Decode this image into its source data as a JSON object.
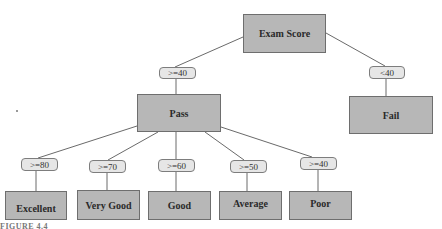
{
  "diagram": {
    "type": "decision-tree",
    "root": {
      "id": "exam",
      "label": "Exam Score"
    },
    "nodes": [
      {
        "id": "exam",
        "label": "Exam Score",
        "x": 243,
        "y": 14,
        "w": 83,
        "h": 39
      },
      {
        "id": "pass",
        "label": "Pass",
        "x": 137,
        "y": 94,
        "w": 84,
        "h": 38
      },
      {
        "id": "fail",
        "label": "Fail",
        "x": 349,
        "y": 96,
        "w": 84,
        "h": 38
      },
      {
        "id": "excellent",
        "label": "Excellent",
        "x": 5,
        "y": 191,
        "w": 62,
        "h": 29
      },
      {
        "id": "verygood",
        "label": "Very Good",
        "x": 77,
        "y": 190,
        "w": 63,
        "h": 30
      },
      {
        "id": "good",
        "label": "Good",
        "x": 148,
        "y": 191,
        "w": 63,
        "h": 29
      },
      {
        "id": "average",
        "label": "Average",
        "x": 219,
        "y": 191,
        "w": 63,
        "h": 29
      },
      {
        "id": "poor",
        "label": "Poor",
        "x": 289,
        "y": 191,
        "w": 63,
        "h": 29
      }
    ],
    "edges": [
      {
        "from": "exam",
        "to": "pass",
        "label": ">=40",
        "pill": {
          "x": 159,
          "y": 67,
          "w": 37,
          "h": 12
        }
      },
      {
        "from": "exam",
        "to": "fail",
        "label": "<40",
        "pill": {
          "x": 369,
          "y": 66,
          "w": 36,
          "h": 13
        }
      },
      {
        "from": "pass",
        "to": "excellent",
        "label": ">=80",
        "pill": {
          "x": 21,
          "y": 158,
          "w": 37,
          "h": 13
        }
      },
      {
        "from": "pass",
        "to": "verygood",
        "label": ">=70",
        "pill": {
          "x": 89,
          "y": 160,
          "w": 37,
          "h": 13
        }
      },
      {
        "from": "pass",
        "to": "good",
        "label": ">=60",
        "pill": {
          "x": 158,
          "y": 159,
          "w": 37,
          "h": 13
        }
      },
      {
        "from": "pass",
        "to": "average",
        "label": ">=50",
        "pill": {
          "x": 230,
          "y": 160,
          "w": 37,
          "h": 13
        }
      },
      {
        "from": "pass",
        "to": "poor",
        "label": ">=40",
        "pill": {
          "x": 300,
          "y": 157,
          "w": 37,
          "h": 13
        }
      }
    ]
  },
  "caption": "FIGURE 4.4"
}
